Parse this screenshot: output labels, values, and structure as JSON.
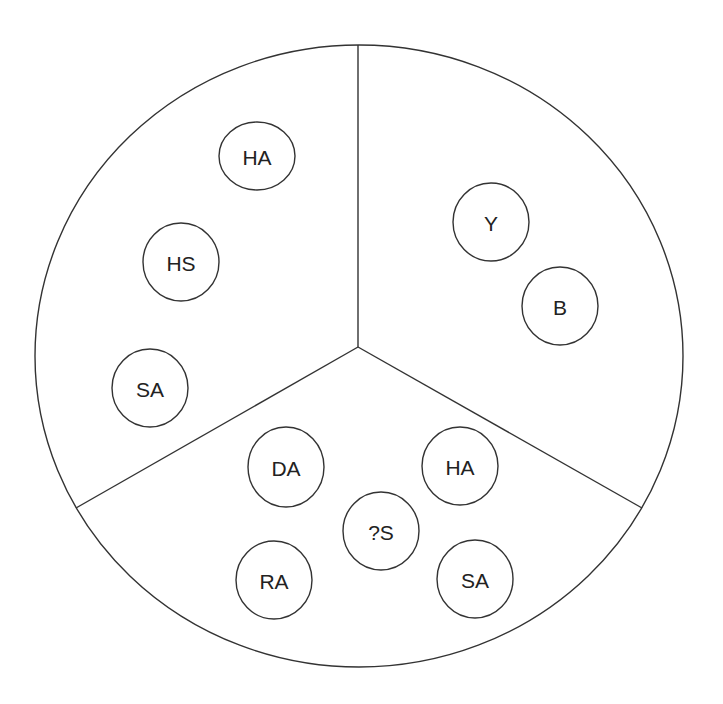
{
  "diagram": {
    "type": "sectored-circle",
    "outer": {
      "cx": 359,
      "cy": 356,
      "rx": 324,
      "ry": 311
    },
    "center": {
      "x": 358,
      "y": 347
    },
    "dividers": [
      {
        "name": "divider-top",
        "x2": 358,
        "y2": 45
      },
      {
        "name": "divider-left",
        "x2": 76,
        "y2": 508
      },
      {
        "name": "divider-right",
        "x2": 642,
        "y2": 508
      }
    ],
    "sectors": [
      {
        "name": "upper-left",
        "nodes": [
          {
            "label": "HA",
            "cx": 257,
            "cy": 156,
            "rx": 38,
            "ry": 34
          },
          {
            "label": "HS",
            "cx": 181,
            "cy": 262,
            "rx": 38,
            "ry": 39
          },
          {
            "label": "SA",
            "cx": 150,
            "cy": 388,
            "rx": 38,
            "ry": 39
          }
        ]
      },
      {
        "name": "upper-right",
        "nodes": [
          {
            "label": "Y",
            "cx": 491,
            "cy": 222,
            "rx": 38,
            "ry": 39
          },
          {
            "label": "B",
            "cx": 560,
            "cy": 306,
            "rx": 38,
            "ry": 39
          }
        ]
      },
      {
        "name": "bottom",
        "nodes": [
          {
            "label": "DA",
            "cx": 286,
            "cy": 467,
            "rx": 38,
            "ry": 40
          },
          {
            "label": "HA",
            "cx": 460,
            "cy": 466,
            "rx": 38,
            "ry": 39
          },
          {
            "label": "?S",
            "cx": 381,
            "cy": 531,
            "rx": 38,
            "ry": 39
          },
          {
            "label": "RA",
            "cx": 274,
            "cy": 580,
            "rx": 38,
            "ry": 39
          },
          {
            "label": "SA",
            "cx": 475,
            "cy": 579,
            "rx": 38,
            "ry": 39
          }
        ]
      }
    ]
  }
}
